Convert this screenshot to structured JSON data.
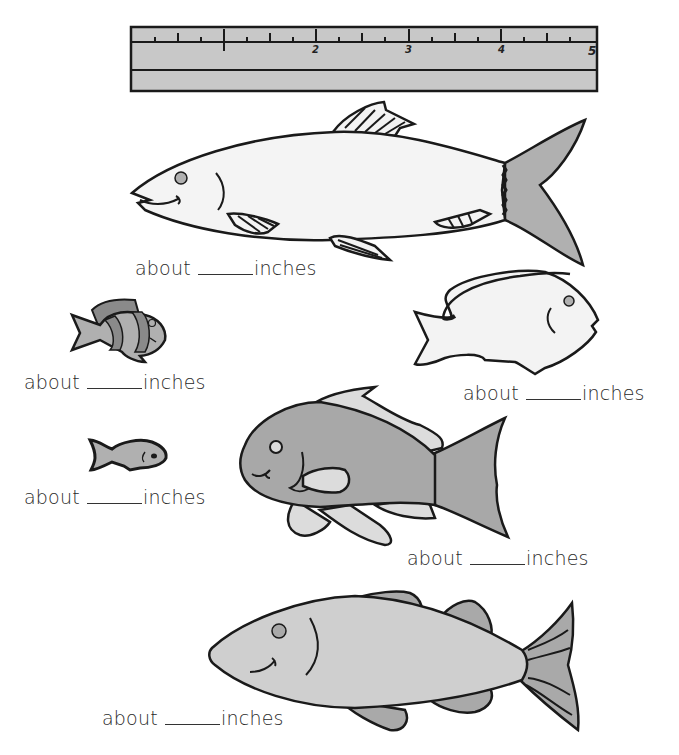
{
  "worksheet": {
    "ruler": {
      "unit": "inches",
      "numbers": [
        "1",
        "2",
        "3",
        "4",
        "5"
      ],
      "color": "#c8c8c8"
    },
    "fish": [
      {
        "id": "fish-1",
        "description": "large white fish with gray forked tail",
        "label_prefix": "about",
        "label_suffix": "inches",
        "answer": ""
      },
      {
        "id": "fish-2",
        "description": "small striped clownfish",
        "label_prefix": "about",
        "label_suffix": "inches",
        "answer": ""
      },
      {
        "id": "fish-3",
        "description": "white tang fish",
        "label_prefix": "about",
        "label_suffix": "inches",
        "answer": ""
      },
      {
        "id": "fish-4",
        "description": "tiny gray fish",
        "label_prefix": "about",
        "label_suffix": "inches",
        "answer": ""
      },
      {
        "id": "fish-5",
        "description": "medium gray fish with light fins",
        "label_prefix": "about",
        "label_suffix": "inches",
        "answer": ""
      },
      {
        "id": "fish-6",
        "description": "large light gray fish with striped tail",
        "label_prefix": "about",
        "label_suffix": "inches",
        "answer": ""
      }
    ],
    "colors": {
      "outline": "#1a1a1a",
      "light_fill": "#f3f3f3",
      "mid_gray": "#b0b0b0",
      "dark_gray": "#8a8a8a",
      "pale_gray": "#dcdcdc",
      "body_gray": "#cfcfcf"
    }
  }
}
